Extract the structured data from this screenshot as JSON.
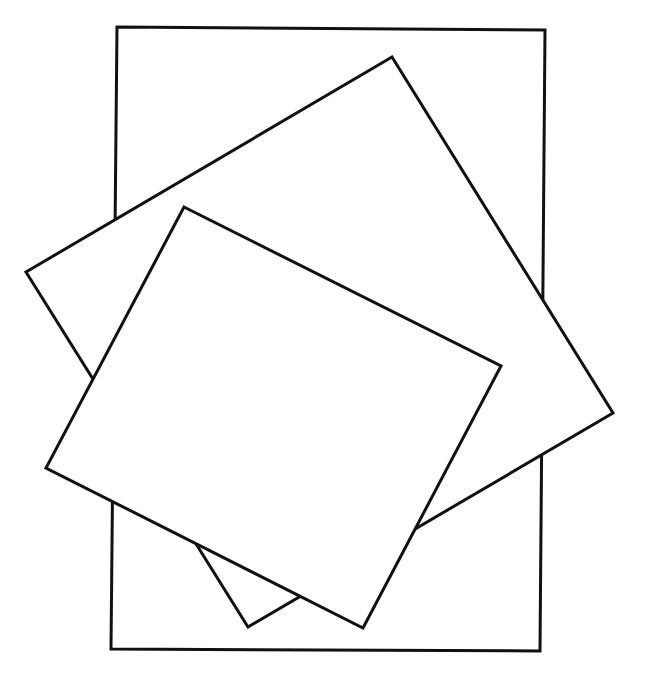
{
  "diagram": {
    "type": "overlapping-quadrilaterals",
    "canvas": {
      "width": 646,
      "height": 678,
      "background": "#ffffff"
    },
    "stroke": {
      "color": "#111111",
      "width": 3
    },
    "fill": "#ffffff",
    "shapes": [
      {
        "id": "rectangle",
        "label": "upright rectangle",
        "layer": 1,
        "points": [
          [
            117,
            27
          ],
          [
            545,
            30
          ],
          [
            540,
            651
          ],
          [
            111,
            649
          ]
        ]
      },
      {
        "id": "large-square",
        "label": "large tilted square",
        "layer": 2,
        "points": [
          [
            392,
            57
          ],
          [
            613,
            413
          ],
          [
            248,
            627
          ],
          [
            26,
            272
          ]
        ]
      },
      {
        "id": "small-square",
        "label": "small tilted square",
        "layer": 3,
        "points": [
          [
            184,
            207
          ],
          [
            501,
            366
          ],
          [
            363,
            628
          ],
          [
            46,
            468
          ]
        ]
      }
    ]
  }
}
